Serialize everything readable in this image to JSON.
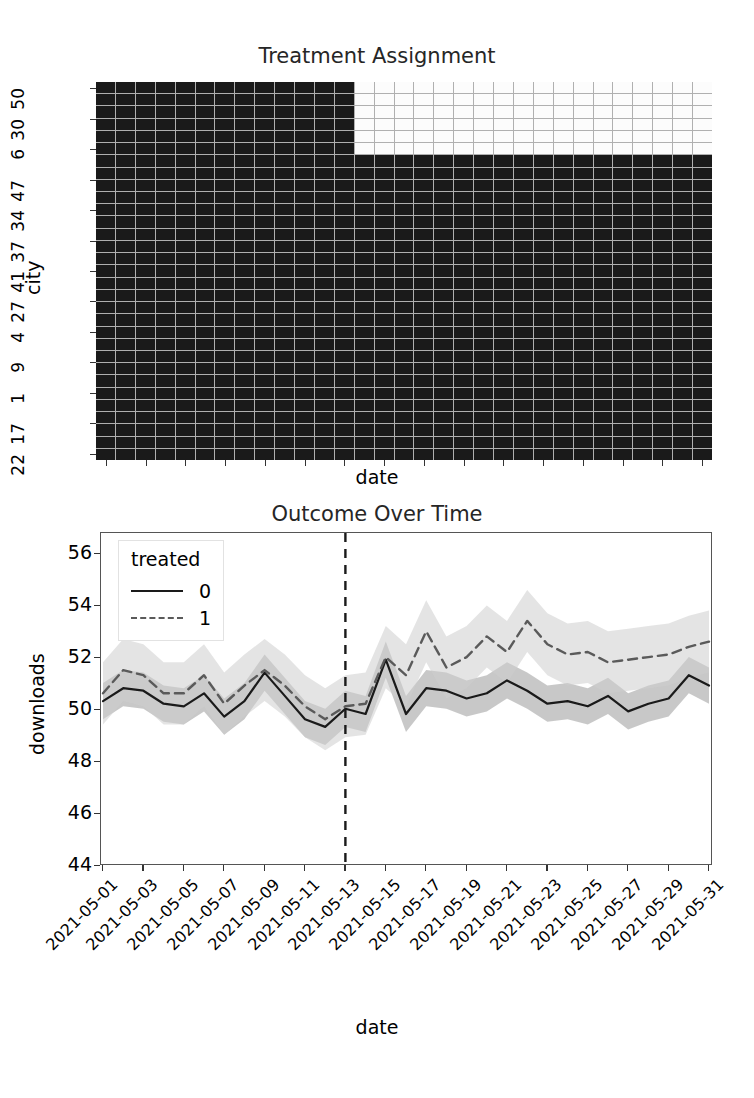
{
  "figure": {
    "width": 754,
    "height": 1098,
    "background": "#ffffff"
  },
  "heatmap": {
    "title": "Treatment Assignment",
    "xlabel": "date",
    "ylabel": "city",
    "y_tick_labels": [
      "50",
      "30",
      "6",
      "47",
      "34",
      "37",
      "41",
      "27",
      "4",
      "9",
      "1",
      "17",
      "22"
    ],
    "colors": {
      "untreated": "#1a1a1a",
      "treated": "#fcfcfc",
      "grid": "#b0b0b0"
    }
  },
  "line": {
    "title": "Outcome Over Time",
    "xlabel": "date",
    "ylabel": "downloads",
    "legend": {
      "title": "treated",
      "entries": [
        {
          "label": "0",
          "style": "solid",
          "color": "#1a1a1a"
        },
        {
          "label": "1",
          "style": "dashed",
          "color": "#5a5a5a"
        }
      ]
    },
    "y_tick_labels": [
      "56",
      "54",
      "52",
      "50",
      "48",
      "46",
      "44"
    ],
    "x_tick_labels": [
      "2021-05-01",
      "2021-05-03",
      "2021-05-05",
      "2021-05-07",
      "2021-05-09",
      "2021-05-11",
      "2021-05-13",
      "2021-05-15",
      "2021-05-17",
      "2021-05-19",
      "2021-05-21",
      "2021-05-23",
      "2021-05-25",
      "2021-05-27",
      "2021-05-29",
      "2021-05-31"
    ],
    "intervention_date": "2021-05-13"
  },
  "chart_data": [
    {
      "type": "heatmap",
      "title": "Treatment Assignment",
      "xlabel": "date",
      "ylabel": "city",
      "x": [
        "2021-05-01",
        "2021-05-02",
        "2021-05-03",
        "2021-05-04",
        "2021-05-05",
        "2021-05-06",
        "2021-05-07",
        "2021-05-08",
        "2021-05-09",
        "2021-05-10",
        "2021-05-11",
        "2021-05-12",
        "2021-05-13",
        "2021-05-14",
        "2021-05-15",
        "2021-05-16",
        "2021-05-17",
        "2021-05-18",
        "2021-05-19",
        "2021-05-20",
        "2021-05-21",
        "2021-05-22",
        "2021-05-23",
        "2021-05-24",
        "2021-05-25",
        "2021-05-26",
        "2021-05-27",
        "2021-05-28",
        "2021-05-29",
        "2021-05-30",
        "2021-05-31"
      ],
      "y": [
        "50",
        "45",
        "30",
        "23",
        "6",
        "12",
        "47",
        "38",
        "34",
        "21",
        "37",
        "15",
        "41",
        "28",
        "27",
        "11",
        "4",
        "19",
        "9",
        "33",
        "1",
        "44",
        "17",
        "25",
        "22",
        "35",
        "13",
        "46",
        "8",
        "31",
        "2"
      ],
      "y_tick_labels": [
        "50",
        "30",
        "6",
        "47",
        "34",
        "37",
        "41",
        "27",
        "4",
        "9",
        "1",
        "17",
        "22"
      ],
      "rows": 31,
      "cols": 31,
      "treated_row_count": 6,
      "treated_start_col_index": 13,
      "legend": "binary: 0 = dark (untreated), 1 = light (treated)",
      "note": "Top 6 cities are treated from 2021-05-14 onward; all other cells are 0."
    },
    {
      "type": "line",
      "title": "Outcome Over Time",
      "xlabel": "date",
      "ylabel": "downloads",
      "ylim": [
        44,
        56.8
      ],
      "grid": false,
      "legend_position": "upper-left",
      "legend_title": "treated",
      "annotations": [
        {
          "type": "vline",
          "x": "2021-05-13",
          "style": "dashed",
          "color": "#1a1a1a"
        }
      ],
      "x": [
        "2021-05-01",
        "2021-05-02",
        "2021-05-03",
        "2021-05-04",
        "2021-05-05",
        "2021-05-06",
        "2021-05-07",
        "2021-05-08",
        "2021-05-09",
        "2021-05-10",
        "2021-05-11",
        "2021-05-12",
        "2021-05-13",
        "2021-05-14",
        "2021-05-15",
        "2021-05-16",
        "2021-05-17",
        "2021-05-18",
        "2021-05-19",
        "2021-05-20",
        "2021-05-21",
        "2021-05-22",
        "2021-05-23",
        "2021-05-24",
        "2021-05-25",
        "2021-05-26",
        "2021-05-27",
        "2021-05-28",
        "2021-05-29",
        "2021-05-30",
        "2021-05-31"
      ],
      "series": [
        {
          "name": "0",
          "style": "solid",
          "color": "#1a1a1a",
          "values": [
            50.3,
            50.8,
            50.7,
            50.2,
            50.1,
            50.6,
            49.7,
            50.3,
            51.4,
            50.5,
            49.6,
            49.3,
            50.0,
            49.8,
            51.9,
            49.8,
            50.8,
            50.7,
            50.4,
            50.6,
            51.1,
            50.7,
            50.2,
            50.3,
            50.1,
            50.5,
            49.9,
            50.2,
            50.4,
            51.3,
            50.9
          ],
          "band_low": [
            49.6,
            50.1,
            50.0,
            49.5,
            49.4,
            49.9,
            49.0,
            49.6,
            50.7,
            49.8,
            48.9,
            48.6,
            49.3,
            49.1,
            51.2,
            49.1,
            50.1,
            50.0,
            49.7,
            49.9,
            50.4,
            50.0,
            49.5,
            49.6,
            49.4,
            49.8,
            49.2,
            49.5,
            49.7,
            50.6,
            50.2
          ],
          "band_high": [
            51.0,
            51.5,
            51.4,
            50.9,
            50.8,
            51.3,
            50.4,
            51.0,
            52.1,
            51.2,
            50.3,
            50.0,
            50.7,
            50.5,
            52.6,
            50.5,
            51.5,
            51.4,
            51.1,
            51.3,
            51.8,
            51.4,
            50.9,
            51.0,
            50.8,
            51.2,
            50.6,
            50.9,
            51.1,
            52.0,
            51.6
          ]
        },
        {
          "name": "1",
          "style": "dashed",
          "color": "#5a5a5a",
          "values": [
            50.6,
            51.5,
            51.3,
            50.6,
            50.6,
            51.3,
            50.2,
            50.9,
            51.5,
            50.9,
            50.1,
            49.6,
            50.1,
            50.2,
            52.0,
            51.3,
            53.0,
            51.6,
            52.0,
            52.8,
            52.2,
            53.4,
            52.5,
            52.1,
            52.2,
            51.8,
            51.9,
            52.0,
            52.1,
            52.4,
            52.6
          ],
          "band_low": [
            49.4,
            50.3,
            50.1,
            49.4,
            49.4,
            50.1,
            49.0,
            49.7,
            50.3,
            49.7,
            48.9,
            48.4,
            48.9,
            49.0,
            50.8,
            50.1,
            51.8,
            50.4,
            50.8,
            51.6,
            51.0,
            52.2,
            51.3,
            50.9,
            51.0,
            50.6,
            50.7,
            50.8,
            50.9,
            51.2,
            51.4
          ],
          "band_high": [
            51.8,
            52.7,
            52.5,
            51.8,
            51.8,
            52.5,
            51.4,
            52.1,
            52.7,
            52.1,
            51.3,
            50.8,
            51.3,
            51.4,
            53.2,
            52.5,
            54.2,
            52.8,
            53.2,
            54.0,
            53.4,
            54.6,
            53.7,
            53.3,
            53.4,
            53.0,
            53.1,
            53.2,
            53.3,
            53.6,
            53.8
          ]
        }
      ]
    }
  ]
}
